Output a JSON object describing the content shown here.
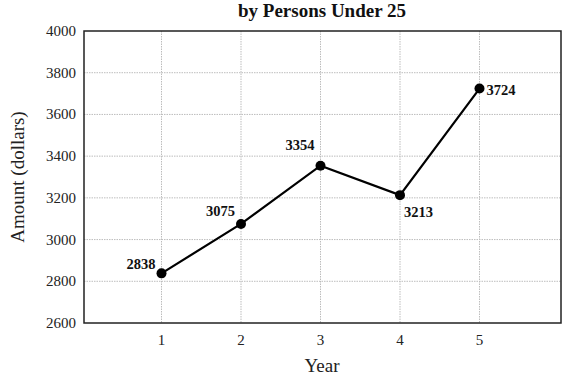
{
  "chart_data": {
    "type": "line",
    "title": "by Persons Under 25",
    "xlabel": "Year",
    "ylabel": "Amount (dollars)",
    "categories": [
      "1",
      "2",
      "3",
      "4",
      "5"
    ],
    "x": [
      1,
      2,
      3,
      4,
      5
    ],
    "values": [
      2838,
      3075,
      3354,
      3213,
      3724
    ],
    "data_labels": [
      "2838",
      "3075",
      "3354",
      "3213",
      "3724"
    ],
    "ylim": [
      2600,
      4000
    ],
    "xlim": [
      0,
      6
    ],
    "yticks": [
      2600,
      2800,
      3000,
      3200,
      3400,
      3600,
      3800,
      4000
    ],
    "xticks": [
      1,
      2,
      3,
      4,
      5
    ],
    "grid": true,
    "legend": null,
    "colors": {
      "line": "#000000",
      "grid": "#bdbdbd",
      "axis": "#222222"
    }
  }
}
